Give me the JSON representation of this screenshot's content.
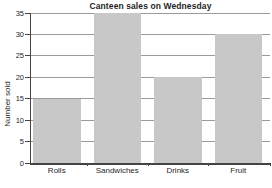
{
  "chart_data": {
    "type": "bar",
    "title": "Canteen sales on Wednesday",
    "categories": [
      "Rolls",
      "Sandwiches",
      "Drinks",
      "Fruit"
    ],
    "values": [
      15,
      35,
      20,
      30
    ],
    "xlabel": "",
    "ylabel": "Number sold",
    "ylim": [
      0,
      35
    ],
    "yticks": [
      0,
      5,
      10,
      15,
      20,
      25,
      30,
      35
    ],
    "grid": true,
    "legend": false,
    "colors": {
      "bar_fill": "#c8c8c8",
      "gridline": "#9b9b9b",
      "axis": "#444444",
      "text": "#1f1f1f",
      "background": "#ffffff"
    }
  }
}
